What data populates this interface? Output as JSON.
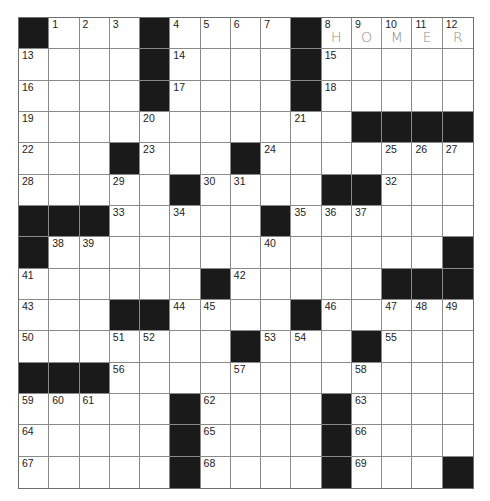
{
  "puzzle": {
    "rows": 15,
    "cols": 15,
    "colors": {
      "black_square": "#1a1a1a",
      "grid_line": "#8a8a8a",
      "pencil": "#8c8c8c"
    },
    "layout": [
      "#...#....#HOMER",
      "....#....#.....",
      "....#....#.....",
      "...........####",
      "...#...#.......",
      ".....#....##...",
      "###.....#......",
      "#.............#",
      "......#.....###",
      "...##....#.....",
      ".......#...#...",
      "###............",
      ".....#....#....",
      ".....#....#....",
      ".....#....#...#"
    ],
    "numbers": {
      "0,1": "1",
      "0,2": "2",
      "0,3": "3",
      "0,5": "4",
      "0,6": "5",
      "0,7": "6",
      "0,8": "7",
      "0,10": "8",
      "0,11": "9",
      "0,12": "10",
      "0,13": "11",
      "0,14": "12",
      "1,0": "13",
      "1,5": "14",
      "1,10": "15",
      "2,0": "16",
      "2,5": "17",
      "2,10": "18",
      "3,0": "19",
      "3,4": "20",
      "3,9": "21",
      "4,0": "22",
      "4,4": "23",
      "4,8": "24",
      "4,12": "25",
      "4,13": "26",
      "4,14": "27",
      "5,0": "28",
      "5,3": "29",
      "5,6": "30",
      "5,7": "31",
      "5,12": "32",
      "6,3": "33",
      "6,5": "34",
      "6,9": "35",
      "6,10": "36",
      "6,11": "37",
      "7,1": "38",
      "7,2": "39",
      "7,8": "40",
      "8,0": "41",
      "8,7": "42",
      "9,0": "43",
      "9,5": "44",
      "9,6": "45",
      "9,10": "46",
      "9,12": "47",
      "9,13": "48",
      "9,14": "49",
      "10,0": "50",
      "10,3": "51",
      "10,4": "52",
      "10,8": "53",
      "10,9": "54",
      "10,12": "55",
      "11,3": "56",
      "11,7": "57",
      "11,11": "58",
      "12,0": "59",
      "12,1": "60",
      "12,2": "61",
      "12,6": "62",
      "12,11": "63",
      "13,0": "64",
      "13,6": "65",
      "13,11": "66",
      "14,0": "67",
      "14,6": "68",
      "14,11": "69"
    },
    "entered_letters": {
      "0,10": "H",
      "0,11": "O",
      "0,12": "M",
      "0,13": "E",
      "0,14": "R"
    }
  }
}
